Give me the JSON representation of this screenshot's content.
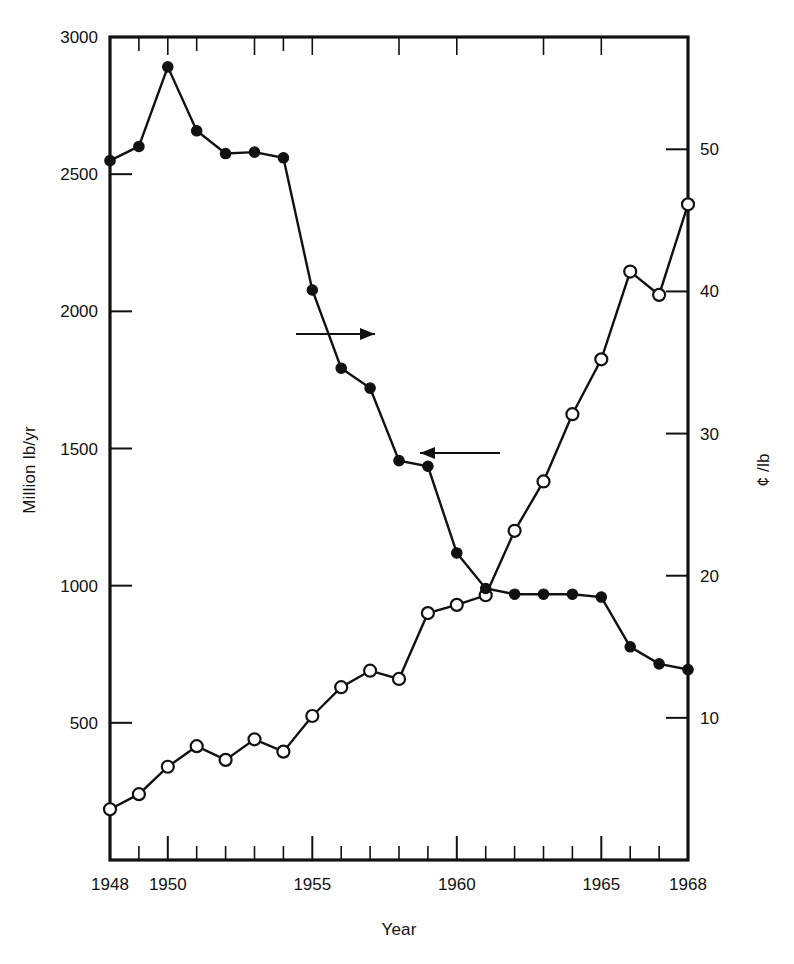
{
  "figure": {
    "xlabel": "Year",
    "ylabel_left": "Million lb/yr",
    "ylabel_right": "¢ /lb",
    "left_ticks": [
      "3000",
      "2500",
      "2000",
      "1500",
      "1000",
      "500"
    ],
    "right_ticks": [
      "50",
      "40",
      "30",
      "20",
      "10"
    ],
    "x_ticks": [
      "1948",
      "1950",
      "1955",
      "1960",
      "1965",
      "1968"
    ],
    "annotations": {
      "arrow_right_label": "arrow pointing to right axis",
      "arrow_left_label": "arrow pointing to left axis"
    }
  },
  "chart_data": {
    "type": "line",
    "title": "",
    "subtitle": "",
    "xlabel": "Year",
    "ylabel": "Million lb/yr",
    "y2label": "¢ /lb",
    "xlim": [
      1948,
      1968
    ],
    "ylim": [
      0,
      3000
    ],
    "y2lim": [
      0,
      57.9
    ],
    "grid": false,
    "legend_position": "none",
    "x_tick_labels": [
      "1948",
      "1950",
      "1955",
      "1960",
      "1965",
      "1968"
    ],
    "x_tick_values": [
      1948,
      1950,
      1955,
      1960,
      1965,
      1968
    ],
    "y_tick_labels": [
      "500",
      "1000",
      "1500",
      "2000",
      "2500",
      "3000"
    ],
    "y_tick_values": [
      500,
      1000,
      1500,
      2000,
      2500,
      3000
    ],
    "y2_tick_labels": [
      "10",
      "20",
      "30",
      "40",
      "50"
    ],
    "y2_tick_values": [
      10,
      20,
      30,
      40,
      50
    ],
    "x": [
      1948,
      1949,
      1950,
      1951,
      1952,
      1953,
      1954,
      1955,
      1956,
      1957,
      1958,
      1959,
      1960,
      1961,
      1962,
      1963,
      1964,
      1965,
      1966,
      1967,
      1968
    ],
    "series": [
      {
        "name": "Production",
        "axis": "left",
        "units": "Million lb/yr",
        "marker": "open-circle",
        "annotation_arrow": "left",
        "values": [
          185,
          240,
          340,
          415,
          365,
          440,
          395,
          525,
          630,
          690,
          660,
          900,
          930,
          965,
          1200,
          1380,
          1625,
          1825,
          2145,
          2060,
          2390
        ]
      },
      {
        "name": "Price",
        "axis": "right",
        "units": "¢ /lb",
        "marker": "filled-circle",
        "annotation_arrow": "right",
        "values": [
          49.2,
          50.2,
          55.8,
          51.3,
          49.7,
          49.8,
          49.4,
          40.1,
          34.6,
          33.2,
          28.1,
          27.7,
          21.6,
          19.1,
          18.7,
          18.7,
          18.7,
          18.5,
          15.0,
          13.8,
          13.4
        ]
      }
    ]
  }
}
